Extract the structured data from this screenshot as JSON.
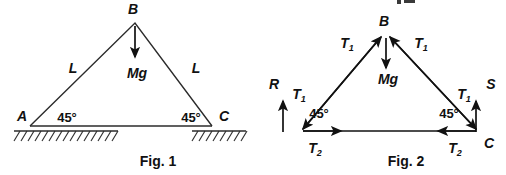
{
  "figures": [
    {
      "caption": "Fig. 1",
      "points": {
        "a": "A",
        "b": "B",
        "c": "C"
      },
      "sides": {
        "left": "L",
        "right": "L"
      },
      "angles": {
        "left": "45°",
        "right": "45°"
      },
      "weight": {
        "base": "M",
        "sub": "g",
        "full": "Mg"
      },
      "supports": {
        "left": "hatched-ground-icon",
        "right": "hatched-ground-icon"
      }
    },
    {
      "caption": "Fig. 2",
      "points": {
        "b": "B",
        "c": "C"
      },
      "angles": {
        "left": "45°",
        "right": "45°"
      },
      "weight": {
        "full": "Mg"
      },
      "forces": {
        "tension_leg": {
          "base": "T",
          "sub": "1"
        },
        "tension_base": {
          "base": "T",
          "sub": "2"
        },
        "reaction_left": "R",
        "reaction_right": "S"
      },
      "clipped_fragment": "√2"
    }
  ],
  "colors": {
    "ink": "#111111",
    "member": "#2b2b2b",
    "background": "#ffffff"
  }
}
